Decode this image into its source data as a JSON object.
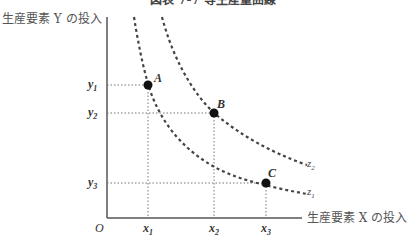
{
  "title": "図表 7-7 等生産量曲線",
  "axes": {
    "y_label": "生産要素 Y の投入",
    "x_label": "生産要素 X の投入",
    "origin": "O"
  },
  "ticks": {
    "x": [
      {
        "base": "x",
        "sub": "1"
      },
      {
        "base": "x",
        "sub": "2"
      },
      {
        "base": "x",
        "sub": "3"
      }
    ],
    "y": [
      {
        "base": "y",
        "sub": "1"
      },
      {
        "base": "y",
        "sub": "2"
      },
      {
        "base": "y",
        "sub": "3"
      }
    ]
  },
  "points": [
    {
      "label": "A",
      "x": "x1",
      "y": "y1",
      "curve": "z1"
    },
    {
      "label": "B",
      "x": "x2",
      "y": "y2",
      "curve": "z2"
    },
    {
      "label": "C",
      "x": "x3",
      "y": "y3",
      "curve": "z1"
    }
  ],
  "curves": [
    {
      "name": "z",
      "sub": "1",
      "style": "dashed"
    },
    {
      "name": "z",
      "sub": "2",
      "style": "dashed"
    }
  ],
  "colors": {
    "axis": "#555555",
    "curve": "#444444",
    "guide": "#777777",
    "point": "#111111"
  }
}
